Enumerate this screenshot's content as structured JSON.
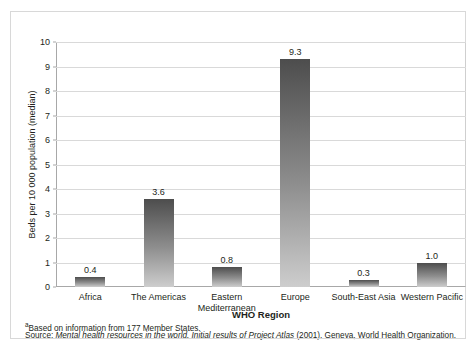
{
  "top_cut_text": "·  ·    ·        ·          ·       ·",
  "chart_data": {
    "type": "bar",
    "title": "",
    "xlabel": "WHO Region",
    "ylabel": "Beds per 10 000 population (median)",
    "categories": [
      "Africa",
      "The Americas",
      "Eastern Mediterranean",
      "Europe",
      "South-East Asia",
      "Western Pacific"
    ],
    "values": [
      0.4,
      3.6,
      0.8,
      9.3,
      0.3,
      1.0
    ],
    "value_labels": [
      "0.4",
      "3.6",
      "0.8",
      "9.3",
      "0.3",
      "1.0"
    ],
    "ylim": [
      0,
      10
    ],
    "yticks": [
      0,
      1,
      2,
      3,
      4,
      5,
      6,
      7,
      8,
      9,
      10
    ],
    "ytick_labels": [
      "0",
      "1",
      "2",
      "3",
      "4",
      "5",
      "6",
      "7",
      "8",
      "9",
      "10"
    ],
    "grid": true,
    "legend": "none",
    "bar_color_top": "#4d4d4d",
    "bar_color_bottom": "#cdcdcd"
  },
  "footnotes": {
    "note_marker": "a",
    "note_text": "Based on information from 177 Member States.",
    "source_prefix": "Source:",
    "source_italic": "Mental health resources in the world. Initial results of Project Atlas",
    "source_suffix": "(2001).  Geneva, World Health Organization."
  }
}
